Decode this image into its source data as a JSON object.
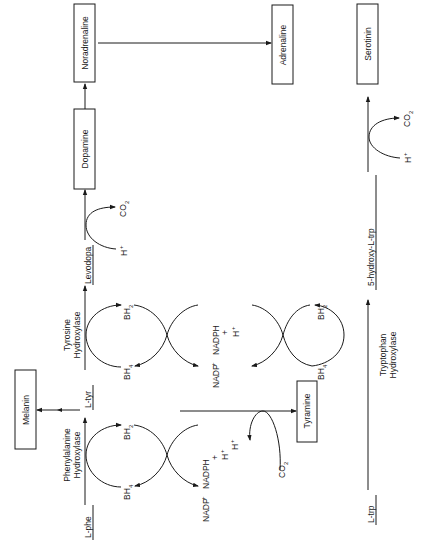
{
  "diagram": {
    "orientation": "rotated-90-ccw",
    "boxes": {
      "noradrenaline": "Noradrenaline",
      "adrenaline": "Adrenaline",
      "serotinin": "Serotinin",
      "dopamine": "Dopamine",
      "melanin": "Melanin",
      "tyramine": "Tyramine"
    },
    "metabolites": {
      "l_phe": "L-phe",
      "l_tyr": "L-tyr",
      "levodopa": "Levodopa",
      "l_trp": "L-trp",
      "hydroxy_trp": "5-hydroxy-L-trp"
    },
    "enzymes": {
      "phe_hydroxylase_1": "Phenylalanine",
      "phe_hydroxylase_2": "Hydroxylase",
      "tyr_hydroxylase_1": "Tyrosine",
      "tyr_hydroxylase_2": "Hydroxylase",
      "trp_hydroxylase_1": "Tryptophan",
      "trp_hydroxylase_2": "Hydroxylase"
    },
    "cofactors": {
      "bh4": "BH",
      "bh4_sub": "4",
      "bh2": "BH",
      "bh2_sub": "2",
      "nadp": "NADP",
      "nadp_sup": "+",
      "nadph": "NADPH",
      "plus": "+",
      "h": "H",
      "h_sup": "+",
      "co2": "CO",
      "co2_sub": "2"
    }
  }
}
